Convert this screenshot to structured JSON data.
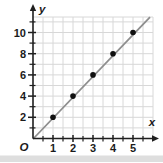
{
  "figure": {
    "background": "#ffffff",
    "bottom_strip_color": "#dedede"
  },
  "chart_data": {
    "type": "scatter",
    "title": "",
    "xlabel": "x",
    "ylabel": "y",
    "origin_label": "O",
    "points": [
      [
        1,
        2
      ],
      [
        2,
        4
      ],
      [
        3,
        6
      ],
      [
        4,
        8
      ],
      [
        5,
        10
      ]
    ],
    "trend_line": {
      "x_start": 0,
      "y_start": 0,
      "x_end": 5.75,
      "y_end": 11.5
    },
    "xlim": [
      0,
      6
    ],
    "ylim": [
      0,
      11.5
    ],
    "x_tick_values": [
      1,
      2,
      3,
      4,
      5
    ],
    "x_tick_labels": [
      "1",
      "2",
      "3",
      "4",
      "5"
    ],
    "x_minor_tick_values": [
      0.5,
      1.5,
      2.5,
      3.5,
      4.5,
      5.5
    ],
    "y_tick_values": [
      2,
      4,
      6,
      8,
      10
    ],
    "y_tick_labels": [
      "2",
      "4",
      "6",
      "8",
      "10"
    ],
    "y_minor_tick_values": [
      1,
      3,
      5,
      7,
      9,
      11
    ],
    "grid": true,
    "grid_x_step": 0.5,
    "grid_y_step": 1,
    "legend": null,
    "colors": {
      "axis": "#1f1f1f",
      "grid": "#d8d8d8",
      "trend_line": "#8e8e8e",
      "point": "#101010",
      "label": "#1b1b1b"
    }
  }
}
